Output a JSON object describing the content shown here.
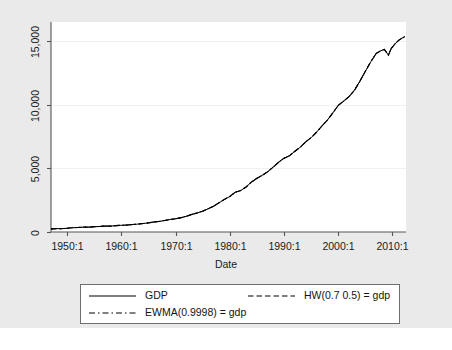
{
  "chart_data": {
    "type": "line",
    "title": "",
    "xlabel": "Date",
    "ylabel": "",
    "xlim": [
      1947.0,
      2012.5
    ],
    "ylim": [
      0,
      16500
    ],
    "grid": true,
    "grid_axis": "y",
    "legend_position": "bottom",
    "x_tick_labels": [
      "1950:1",
      "1960:1",
      "1970:1",
      "1980:1",
      "1990:1",
      "2000:1",
      "2010:1"
    ],
    "x_tick_values": [
      1950,
      1960,
      1970,
      1980,
      1990,
      2000,
      2010
    ],
    "y_tick_labels": [
      "0",
      "5,000",
      "10,000",
      "15,000"
    ],
    "y_tick_values": [
      0,
      5000,
      10000,
      15000
    ],
    "series": [
      {
        "name": "GDP",
        "style": "solid",
        "color": "#000000",
        "x": [
          1947.0,
          1947.25,
          1947.5,
          1947.75,
          1948.0,
          1949.0,
          1950.0,
          1951.0,
          1952.0,
          1953.0,
          1954.0,
          1955.0,
          1956.0,
          1957.0,
          1958.0,
          1959.0,
          1960.0,
          1961.0,
          1962.0,
          1963.0,
          1964.0,
          1965.0,
          1966.0,
          1967.0,
          1968.0,
          1969.0,
          1970.0,
          1971.0,
          1972.0,
          1973.0,
          1974.0,
          1975.0,
          1976.0,
          1977.0,
          1978.0,
          1979.0,
          1980.0,
          1981.0,
          1982.0,
          1983.0,
          1984.0,
          1985.0,
          1986.0,
          1987.0,
          1988.0,
          1989.0,
          1990.0,
          1991.0,
          1992.0,
          1993.0,
          1994.0,
          1995.0,
          1996.0,
          1997.0,
          1998.0,
          1999.0,
          2000.0,
          2001.0,
          2002.0,
          2003.0,
          2004.0,
          2005.0,
          2006.0,
          2007.0,
          2007.75,
          2008.5,
          2009.25,
          2009.75,
          2010.5,
          2011.25,
          2012.25
        ],
        "y": [
          243,
          246,
          250,
          260,
          266,
          267,
          294,
          339,
          358,
          380,
          380,
          415,
          438,
          464,
          461,
          504,
          527,
          545,
          586,
          618,
          663,
          719,
          788,
          833,
          910,
          985,
          1040,
          1127,
          1238,
          1383,
          1500,
          1638,
          1825,
          2031,
          2295,
          2563,
          2790,
          3128,
          3255,
          3537,
          3933,
          4220,
          4463,
          4740,
          5100,
          5482,
          5801,
          5992,
          6342,
          6667,
          7085,
          7415,
          7839,
          8332,
          8794,
          9354,
          9952,
          10286,
          10642,
          11142,
          11853,
          12623,
          13377,
          14030,
          14220,
          14350,
          13900,
          14400,
          14800,
          15100,
          15350
        ]
      },
      {
        "name": "HW(0.7 0.5) = gdp",
        "style": "dashed",
        "color": "#000000"
      },
      {
        "name": "EWMA(0.9998) = gdp",
        "style": "dashdot",
        "color": "#000000"
      }
    ]
  },
  "axes": {
    "x_title": "Date",
    "x_ticks": [
      "1950:1",
      "1960:1",
      "1970:1",
      "1980:1",
      "1990:1",
      "2000:1",
      "2010:1"
    ],
    "y_ticks": [
      "0",
      "5,000",
      "10,000",
      "15,000"
    ]
  },
  "legend": {
    "entries": [
      {
        "label": "GDP",
        "style": "solid"
      },
      {
        "label": "HW(0.7 0.5) = gdp",
        "style": "dashed"
      },
      {
        "label": "EWMA(0.9998) = gdp",
        "style": "dashdot"
      }
    ]
  },
  "colors": {
    "canvas": "#eaeaea",
    "plot_background": "#ffffff",
    "axis": "#4d4d4d",
    "grid": "#f2f2f2",
    "line": "#000000",
    "text": "#1a1a1a"
  }
}
